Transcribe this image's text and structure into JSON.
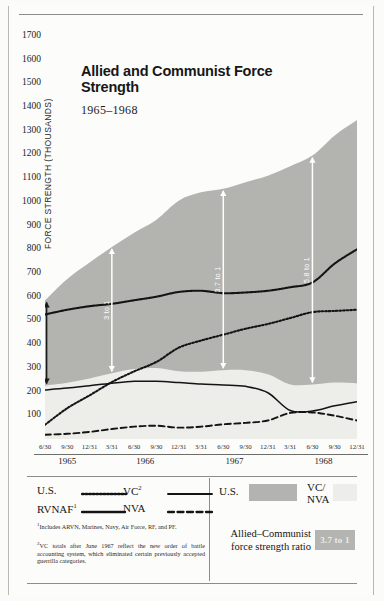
{
  "chart_data": {
    "type": "area",
    "title": "Allied and Communist Force Strength",
    "subtitle": "1965–1968",
    "ylabel": "FORCE STRENGTH (THOUSANDS)",
    "xlabel": "",
    "ylim": [
      0,
      1750
    ],
    "yticks": [
      100,
      200,
      300,
      400,
      500,
      600,
      700,
      800,
      900,
      1000,
      1100,
      1200,
      1300,
      1400,
      1500,
      1600,
      1700
    ],
    "grid": false,
    "legend_position": "bottom",
    "x": [
      "6/30",
      "9/30",
      "12/31",
      "3/31",
      "6/30",
      "9/30",
      "12/31",
      "3/31",
      "6/30",
      "9/30",
      "12/31",
      "3/31",
      "6/30",
      "9/30",
      "12/31"
    ],
    "year_groups": [
      {
        "year": "1965",
        "quarters": [
          "6/30",
          "9/30",
          "12/31"
        ]
      },
      {
        "year": "1966",
        "quarters": [
          "3/31",
          "6/30",
          "9/30",
          "12/31"
        ]
      },
      {
        "year": "1967",
        "quarters": [
          "3/31",
          "6/30",
          "9/30",
          "12/31"
        ]
      },
      {
        "year": "1968",
        "quarters": [
          "3/31",
          "6/30",
          "9/30",
          "12/31"
        ]
      }
    ],
    "series": [
      {
        "name": "U.S.",
        "style": "dotted",
        "values": [
          60,
          130,
          184,
          240,
          285,
          325,
          385,
          415,
          440,
          465,
          485,
          510,
          535,
          540,
          545
        ]
      },
      {
        "name": "RVNAF",
        "style": "beaded",
        "values": [
          525,
          545,
          560,
          570,
          585,
          600,
          620,
          625,
          615,
          618,
          625,
          640,
          660,
          740,
          800
        ]
      },
      {
        "name": "VC",
        "style": "solid",
        "values": [
          207,
          215,
          225,
          235,
          243,
          243,
          238,
          232,
          228,
          222,
          195,
          120,
          118,
          140,
          157
        ]
      },
      {
        "name": "NVA",
        "style": "dashed",
        "values": [
          18,
          22,
          30,
          42,
          52,
          56,
          48,
          52,
          62,
          68,
          78,
          110,
          112,
          98,
          78
        ]
      }
    ],
    "stacked_areas": [
      {
        "name": "U.S.",
        "fill": "#b3b3b0",
        "values": [
          585,
          675,
          744,
          810,
          870,
          925,
          1005,
          1040,
          1055,
          1083,
          1110,
          1150,
          1195,
          1280,
          1345
        ]
      },
      {
        "name": "VC/NVA",
        "fill": "#ededea",
        "values": [
          225,
          237,
          255,
          277,
          295,
          299,
          286,
          284,
          290,
          290,
          273,
          230,
          230,
          238,
          235
        ]
      }
    ],
    "ratio_annotations": [
      {
        "label": "2.7 to 1",
        "at": "6/30/1965"
      },
      {
        "label": "3 to 1",
        "at": "3/31/1966"
      },
      {
        "label": "3.7 to 1",
        "at": "6/30/1967"
      },
      {
        "label": "5.8 to 1",
        "at": "6/30/1968"
      }
    ]
  },
  "legend": {
    "lines": [
      {
        "label": "U.S.",
        "style": "dotted"
      },
      {
        "label": "VC",
        "style": "solid",
        "sup": "2"
      },
      {
        "label": "RVNAF",
        "style": "beaded",
        "sup": "1"
      },
      {
        "label": "NVA",
        "style": "dashed"
      }
    ],
    "footnotes": [
      "Includes ARVN, Marines, Navy, Air Force, RF, and PF.",
      "VC totals after June 1967 reflect the new order of battle accounting system, which eliminated certain previously accepted guerrilla categories."
    ],
    "footnote_marks": [
      "1",
      "2"
    ]
  },
  "key": {
    "swatches": [
      {
        "label": "U.S.",
        "color": "#b3b3b0"
      },
      {
        "label": "VC/\nNVA",
        "color": "#ededea"
      }
    ],
    "us_label": "U.S.",
    "vcnva_label_line1": "VC/",
    "vcnva_label_line2": "NVA",
    "ratio_caption": "Allied–Communist force strength ratio",
    "ratio_value": "3.7 to 1"
  },
  "colors": {
    "allied_fill": "#b3b3b0",
    "communist_fill": "#ededea",
    "ink": "#171717",
    "badge": "#b4b4b0"
  }
}
